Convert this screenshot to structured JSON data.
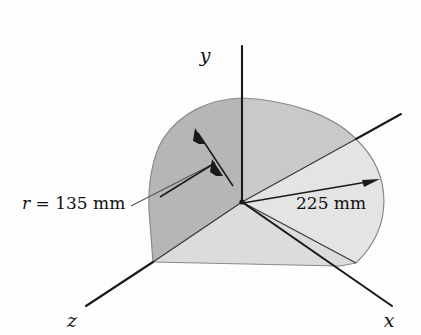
{
  "figure": {
    "type": "engineering-diagram",
    "background_color": "#fdfdfd",
    "axes": [
      {
        "id": "y",
        "label": "y",
        "label_x": 205,
        "label_y": 62,
        "x1": 242,
        "y1": 202,
        "x2": 242,
        "y2": 46
      },
      {
        "id": "z",
        "label": "z",
        "label_x": 72,
        "label_y": 327,
        "x1": 242,
        "y1": 202,
        "x2": 86,
        "y2": 306
      },
      {
        "id": "x",
        "label": "x",
        "label_x": 389,
        "label_y": 327,
        "x1": 242,
        "y1": 202,
        "x2": 392,
        "y2": 306
      }
    ],
    "dimensions": [
      {
        "id": "radius-135",
        "text_prefix": "r",
        "text_equals": " = ",
        "text_value": "135 mm",
        "full_text": "r = 135 mm",
        "label_x": 22,
        "label_y": 209,
        "arrow_style": "double-headed",
        "from": {
          "x": 242,
          "y": 202
        },
        "to": {
          "x": 196,
          "y": 131
        }
      },
      {
        "id": "radius-225",
        "text_prefix": "",
        "text_equals": "",
        "text_value": "225 mm",
        "full_text": "225 mm",
        "label_x": 296,
        "label_y": 209,
        "arrow_style": "single-headed",
        "from": {
          "x": 242,
          "y": 202
        },
        "to": {
          "x": 375,
          "y": 180
        }
      }
    ],
    "regions": [
      {
        "id": "sector-left-dark",
        "fill": "#b6b6b6",
        "name": "left-sector-face"
      },
      {
        "id": "sector-mid-grey",
        "fill": "#c9c9c9",
        "name": "upper-sector-face"
      },
      {
        "id": "sector-right-light",
        "fill": "#e4e4e4",
        "name": "right-sector-face"
      },
      {
        "id": "sector-lower-light",
        "fill": "#dcdcdc",
        "name": "lower-sector-face"
      }
    ],
    "origin": {
      "x": 242,
      "y": 202,
      "marker": "vertex-dot"
    }
  }
}
